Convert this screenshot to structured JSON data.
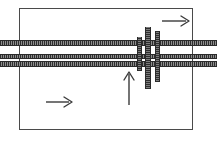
{
  "diagram": {
    "frame": {
      "name": "outer-boundary-rectangle",
      "stroke_color": "#4a4a4a"
    },
    "bands": [
      {
        "label": "upper horizontal track",
        "orientation": "horizontal",
        "order": 1
      },
      {
        "label": "middle horizontal track",
        "orientation": "horizontal",
        "order": 2
      },
      {
        "label": "lower horizontal track",
        "orientation": "horizontal",
        "order": 3
      }
    ],
    "crossing_bars": [
      {
        "label": "left vertical bar",
        "orientation": "vertical",
        "order": 1
      },
      {
        "label": "center vertical bar",
        "orientation": "vertical",
        "order": 2
      },
      {
        "label": "right vertical bar",
        "orientation": "vertical",
        "order": 3
      }
    ],
    "arrows": [
      {
        "label": "top right direction arrow",
        "direction": "right"
      },
      {
        "label": "bottom left direction arrow",
        "direction": "right"
      },
      {
        "label": "center upward direction arrow",
        "direction": "up"
      }
    ],
    "colors": {
      "track_dark": "#2e2e2e",
      "track_light": "#8c8c8c",
      "bar_fill": "#4d4d4d",
      "arrow": "#3a3a3a",
      "frame": "#4a4a4a",
      "background": "#ffffff"
    }
  }
}
